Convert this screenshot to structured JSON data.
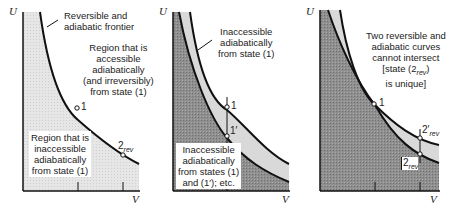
{
  "axes": {
    "y_label": "U",
    "x_label": "V"
  },
  "panels": [
    {
      "id": "a",
      "labels": {
        "frontier": "Reversible and\nadiabatic frontier",
        "frontier_l1": "Reversible and",
        "frontier_l2": "adiabatic frontier",
        "accessible_l1": "Region that is",
        "accessible_l2": "accessible",
        "accessible_l3": "adiabatically",
        "accessible_l4": "(and irreversibly)",
        "accessible_l5": "from state (1)",
        "inaccessible_l1": "Region that is",
        "inaccessible_l2": "inaccessible",
        "inaccessible_l3": "adiabatically",
        "inaccessible_l4": "from state (1)"
      },
      "points": {
        "p1": "1",
        "p2": "2",
        "p2_sub": "rev"
      }
    },
    {
      "id": "b",
      "labels": {
        "band_l1": "Inaccessible",
        "band_l2": "adiabatically",
        "band_l3": "from state (1)",
        "region_l1": "Inaccessible",
        "region_l2": "adiabatically",
        "region_l3": "from states (1)",
        "region_l4": "and (1′); etc."
      },
      "points": {
        "p1": "1",
        "p1prime": "1′"
      }
    },
    {
      "id": "c",
      "labels": {
        "note_l1": "Two reversible and",
        "note_l2": "adiabatic curves",
        "note_l3": "cannot intersect",
        "note_l4": "[state (2",
        "note_l4_sub": "rev",
        "note_l4_end": ")",
        "note_l5": "is unique]"
      },
      "points": {
        "p1": "1",
        "p2prime": "2′",
        "p2prime_sub": "rev",
        "p2": "2",
        "p2_sub": "rev"
      }
    }
  ],
  "colors": {
    "light_region": "#e4e4e4",
    "band": "#d9d9d9",
    "dark_region": "#8c8c8c",
    "line": "#111111"
  }
}
